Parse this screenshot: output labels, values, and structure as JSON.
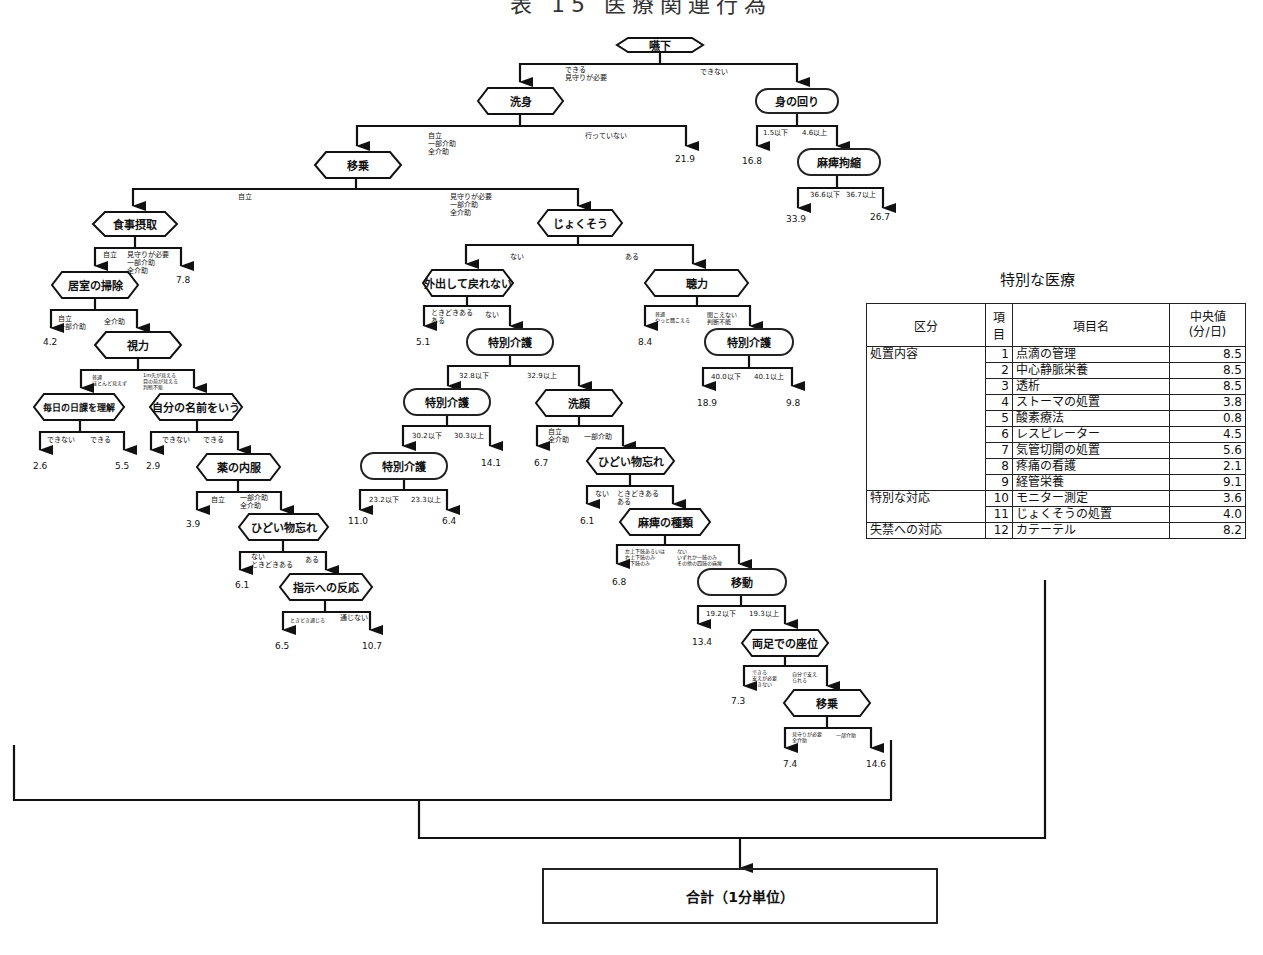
{
  "title": "表 15 医療関連行為",
  "tree": {
    "nodes": {
      "n_enge": "嚥下",
      "n_senshin": "洗身",
      "n_minomawari": "身の回り",
      "n_ijou1": "移乗",
      "n_mahi_kousyuku": "麻痺拘縮",
      "n_shokuji": "食事摂取",
      "n_jokusou": "じょくそう",
      "n_kyoshitsu": "居室の掃除",
      "n_shiryoku": "視力",
      "n_gaishutsu": "外出して戻れない",
      "n_chouryoku": "聴力",
      "n_mainichi": "毎日の日課を理解",
      "n_namae": "自分の名前をいう",
      "n_tokubetsu1": "特別介護",
      "n_tokubetsu_r": "特別介護",
      "n_kusuri": "薬の内服",
      "n_tokubetsu2": "特別介護",
      "n_sengan": "洗顔",
      "n_tokubetsu3": "特別介護",
      "n_hidoi1": "ひどい物忘れ",
      "n_hidoi2": "ひどい物忘れ",
      "n_shiji": "指示への反応",
      "n_mahi_shurui": "麻痺の種類",
      "n_idou": "移動",
      "n_ryoashi": "両足での座位",
      "n_ijou2": "移乗"
    },
    "branch_labels": {
      "enge_l": "できる\n見守りが必要",
      "enge_r": "できない",
      "senshin_l": "自立\n一部介助\n全介助",
      "senshin_r": "行っていない",
      "mino_l": "1.5以下",
      "mino_r": "4.6以上",
      "mahi_l": "36.6以下",
      "mahi_r": "36.7以上",
      "ijou_l": "自立",
      "ijou_r": "見守りが必要\n一部介助\n全介助",
      "shokuji_l": "自立",
      "shokuji_r": "見守りが必要\n一部介助\n全介助",
      "kyoshitsu_l": "自立\n一部介助",
      "kyoshitsu_r": "全介助",
      "shiryoku_l": "普通\nほとんど見えず",
      "shiryoku_r": "1m先が見える\n目の前が見える\n判断不能",
      "mainichi_l": "できない",
      "mainichi_r": "できる",
      "namae_l": "できない",
      "namae_r": "できる",
      "kusuri_l": "自立",
      "kusuri_r": "一部介助\n全介助",
      "hidoi1_l": "ない\nときどきある",
      "hidoi1_r": "ある",
      "shiji_l": "ときどき通じる",
      "shiji_r": "通じない",
      "jokusou_l": "ない",
      "jokusou_r": "ある",
      "gaishutsu_l": "ときどきある\nある",
      "gaishutsu_r": "ない",
      "chouryoku_l": "普通\nやっと聞こえる",
      "chouryoku_r": "聞こえない\n判断不能",
      "tok1_l": "32.8以下",
      "tok1_r": "32.9以上",
      "tokr_l": "40.0以下",
      "tokr_r": "40.1以上",
      "tok2_l": "30.2以下",
      "tok2_r": "30.3以上",
      "sengan_l": "自立\n全介助",
      "sengan_r": "一部介助",
      "tok3_l": "23.2以下",
      "tok3_r": "23.3以上",
      "hidoi2_l": "ない",
      "hidoi2_r": "ときどきある\nある",
      "mahishu_l": "左上下肢あるいは\n右上下肢のみ\n両下肢のみ",
      "mahishu_r": "ない\nいずれか一肢のみ\nその他の四肢の麻痺",
      "idou_l": "19.2以下",
      "idou_r": "19.3以上",
      "ryoashi_l": "できる\n支えが必要\nできない",
      "ryoashi_r": "自分で支え\nられる",
      "ijou2_l": "見守りが必要\n全介助",
      "ijou2_r": "一部介助"
    },
    "leaf_values": {
      "v_senshin_r": "21.9",
      "v_mino_l": "16.8",
      "v_mahi_l": "33.9",
      "v_mahi_r": "26.7",
      "v_shokuji_r": "7.8",
      "v_kyoshitsu_l": "4.2",
      "v_mainichi_l": "2.6",
      "v_mainichi_r": "5.5",
      "v_namae_l": "2.9",
      "v_kusuri_l": "3.9",
      "v_hidoi1_l": "6.1",
      "v_shiji_l": "6.5",
      "v_shiji_r": "10.7",
      "v_gaishutsu_l": "5.1",
      "v_chouryoku_l": "8.4",
      "v_tokr_l": "18.9",
      "v_tokr_r": "9.8",
      "v_tok2_r": "14.1",
      "v_tok3_l": "11.0",
      "v_tok3_r": "6.4",
      "v_sengan_l": "6.7",
      "v_hidoi2_l": "6.1",
      "v_mahishu_l": "6.8",
      "v_idou_l": "13.4",
      "v_ryoashi_l": "7.3",
      "v_ijou2_l": "7.4",
      "v_ijou2_r": "14.6"
    }
  },
  "special_care": {
    "title": "特別な医療",
    "headers": [
      "区分",
      "項目",
      "項目名",
      "中央値\n(分/日)"
    ],
    "rows": [
      {
        "category": "処置内容",
        "no": "1",
        "name": "点滴の管理",
        "median": "8.5"
      },
      {
        "category": "",
        "no": "2",
        "name": "中心静脈栄養",
        "median": "8.5"
      },
      {
        "category": "",
        "no": "3",
        "name": "透析",
        "median": "8.5"
      },
      {
        "category": "",
        "no": "4",
        "name": "ストーマの処置",
        "median": "3.8"
      },
      {
        "category": "",
        "no": "5",
        "name": "酸素療法",
        "median": "0.8"
      },
      {
        "category": "",
        "no": "6",
        "name": "レスピレーター",
        "median": "4.5"
      },
      {
        "category": "",
        "no": "7",
        "name": "気管切開の処置",
        "median": "5.6"
      },
      {
        "category": "",
        "no": "8",
        "name": "疼痛の看護",
        "median": "2.1"
      },
      {
        "category": "",
        "no": "9",
        "name": "経管栄養",
        "median": "9.1"
      },
      {
        "category": "特別な対応",
        "no": "10",
        "name": "モニター測定",
        "median": "3.6"
      },
      {
        "category": "",
        "no": "11",
        "name": "じょくそうの処置",
        "median": "4.0"
      },
      {
        "category": "失禁への対応",
        "no": "12",
        "name": "カテーテル",
        "median": "8.2"
      }
    ]
  },
  "total_box": "合計（1分単位）"
}
